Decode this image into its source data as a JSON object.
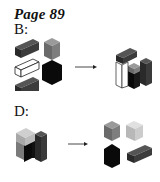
{
  "page_title": "Page 89",
  "puzzles": [
    {
      "label": "B:",
      "before_blocks": [
        "dark-gray bar",
        "gray cube",
        "white bar",
        "black hexagonal block",
        "dark-gray bar"
      ],
      "arrow": "right-arrow",
      "after_blocks": [
        "assembled stack: dark-gray bar on top, white bar, gray/black cubes, dark-gray column"
      ]
    },
    {
      "label": "D:",
      "before_blocks": [
        "assembled stack: light-gray cube on top, gray/black blocks, dark-gray column"
      ],
      "arrow": "right-arrow",
      "after_blocks": [
        "gray cube",
        "light-gray cube",
        "black block",
        "dark-gray bar"
      ]
    }
  ],
  "colors": {
    "black": "#0a0a0a",
    "dark_gray": "#3a3a3a",
    "gray": "#7a7a7a",
    "light_gray": "#c8c8c8",
    "white": "#ffffff"
  }
}
